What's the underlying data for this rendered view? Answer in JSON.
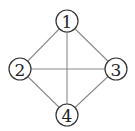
{
  "diagram": {
    "type": "graph",
    "nodes": [
      {
        "id": "1",
        "label": "1",
        "x": 67,
        "y": 21
      },
      {
        "id": "2",
        "label": "2",
        "x": 20,
        "y": 69
      },
      {
        "id": "3",
        "label": "3",
        "x": 116,
        "y": 69
      },
      {
        "id": "4",
        "label": "4",
        "x": 67,
        "y": 115
      }
    ],
    "edges": [
      {
        "from": "1",
        "to": "2"
      },
      {
        "from": "1",
        "to": "3"
      },
      {
        "from": "1",
        "to": "4"
      },
      {
        "from": "2",
        "to": "3"
      },
      {
        "from": "2",
        "to": "4"
      },
      {
        "from": "3",
        "to": "4"
      }
    ],
    "node_radius": 11,
    "colors": {
      "edge": "#8a8a8a",
      "node_stroke": "#333333",
      "label": "#222222",
      "background": "#ffffff"
    }
  }
}
